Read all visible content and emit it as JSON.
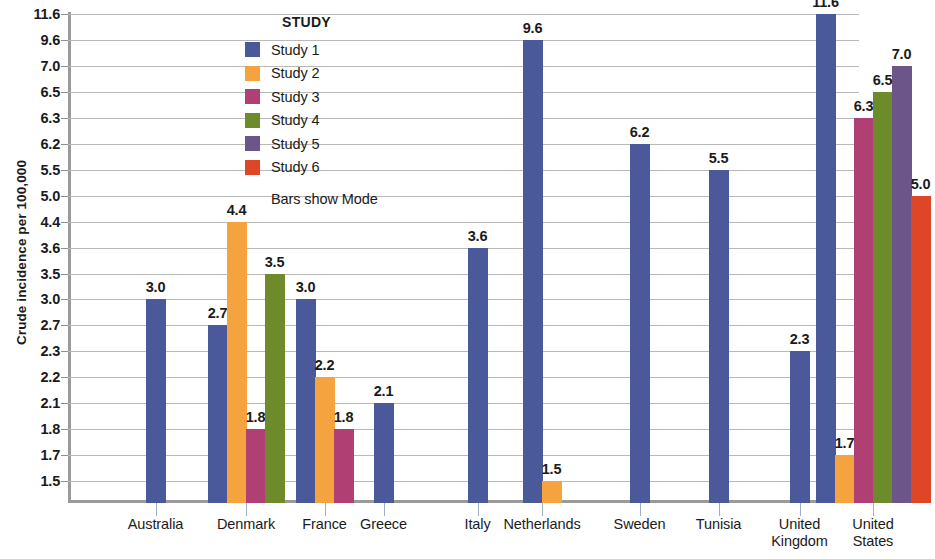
{
  "chart_data": {
    "type": "bar",
    "title": "",
    "xlabel": "",
    "ylabel": "Crude incidence per 100,000",
    "grid": true,
    "legend_position": "inside-top-left",
    "legend_title": "STUDY",
    "note": "Bars show Mode",
    "axis_note": "Y axis is ordinal: tick labels are the distinct observed values, evenly spaced.",
    "ytick_labels": [
      "11.6",
      "9.6",
      "7.0",
      "6.5",
      "6.3",
      "6.2",
      "5.5",
      "5.0",
      "4.4",
      "3.6",
      "3.5",
      "3.0",
      "2.7",
      "2.3",
      "2.2",
      "2.1",
      "1.8",
      "1.7",
      "1.5"
    ],
    "categories": [
      "Australia",
      "Denmark",
      "France",
      "Greece",
      "Italy",
      "Netherlands",
      "Sweden",
      "Tunisia",
      "United Kingdom",
      "United States"
    ],
    "category_lines": [
      [
        "Australia"
      ],
      [
        "Denmark"
      ],
      [
        "France"
      ],
      [
        "Greece"
      ],
      [
        "Italy"
      ],
      [
        "Netherlands"
      ],
      [
        "Sweden"
      ],
      [
        "Tunisia"
      ],
      [
        "United",
        "Kingdom"
      ],
      [
        "United",
        "States"
      ]
    ],
    "series": [
      {
        "name": "Study 1",
        "color": "#4a5999",
        "values": [
          3.0,
          2.7,
          3.0,
          2.1,
          3.6,
          9.6,
          6.2,
          5.5,
          2.3,
          11.6
        ]
      },
      {
        "name": "Study 2",
        "color": "#f5a33e",
        "values": [
          null,
          4.4,
          2.2,
          null,
          null,
          1.5,
          null,
          null,
          null,
          1.7
        ]
      },
      {
        "name": "Study 3",
        "color": "#b04074",
        "values": [
          null,
          1.8,
          1.8,
          null,
          null,
          null,
          null,
          null,
          null,
          6.3
        ]
      },
      {
        "name": "Study 4",
        "color": "#6d8b2b",
        "values": [
          null,
          3.5,
          null,
          null,
          null,
          null,
          null,
          null,
          null,
          6.5
        ]
      },
      {
        "name": "Study 5",
        "color": "#6b5589",
        "values": [
          null,
          null,
          null,
          null,
          null,
          null,
          null,
          null,
          null,
          7.0
        ]
      },
      {
        "name": "Study 6",
        "color": "#df4628",
        "values": [
          null,
          null,
          null,
          null,
          null,
          null,
          null,
          null,
          null,
          5.0
        ]
      }
    ],
    "bar_labels": {
      "Australia": [
        "3.0"
      ],
      "Denmark": [
        "2.7",
        "4.4",
        "1.8",
        "3.5"
      ],
      "France": [
        "3.0",
        "2.2",
        "1.8"
      ],
      "Greece": [
        "2.1"
      ],
      "Italy": [
        "3.6"
      ],
      "Netherlands": [
        "9.6",
        "1.5"
      ],
      "Sweden": [
        "6.2"
      ],
      "Tunisia": [
        "5.5"
      ],
      "United Kingdom": [
        "2.3"
      ],
      "United States": [
        "11.6",
        "1.7",
        "6.3",
        "6.5",
        "7.0",
        "5.0"
      ]
    }
  },
  "legend": {
    "title": "STUDY",
    "items": [
      {
        "label": "Study 1",
        "color": "#4a5999"
      },
      {
        "label": "Study 2",
        "color": "#f5a33e"
      },
      {
        "label": "Study 3",
        "color": "#b04074"
      },
      {
        "label": "Study 4",
        "color": "#6d8b2b"
      },
      {
        "label": "Study 5",
        "color": "#6b5589"
      },
      {
        "label": "Study 6",
        "color": "#df4628"
      }
    ],
    "note": "Bars show Mode"
  },
  "axes": {
    "y_title": "Crude incidence per 100,000"
  }
}
